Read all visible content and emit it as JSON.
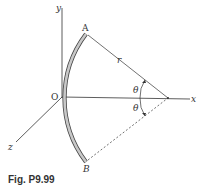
{
  "figure": {
    "caption": "Fig. P9.99",
    "axes": {
      "x_label": "x",
      "y_label": "y",
      "z_label": "z",
      "origin_label": "O"
    },
    "points": {
      "A": "A",
      "B": "B"
    },
    "dimensions": {
      "radius_label": "r",
      "angle_upper_label": "θ",
      "angle_lower_label": "θ"
    },
    "colors": {
      "lines": "#333333",
      "rod_fill": "#c8c8c8",
      "rod_outline": "#444444"
    }
  }
}
